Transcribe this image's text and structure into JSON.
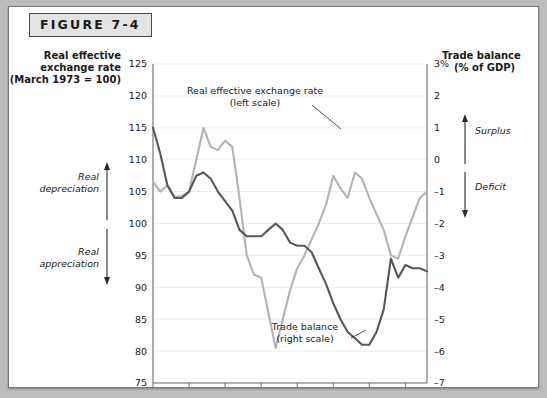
{
  "figure": {
    "label": "FIGURE 7-4"
  },
  "left_axis": {
    "title_line1": "Real effective",
    "title_line2": "exchange rate",
    "title_line3": "(March 1973 = 100)",
    "ticks": [
      "125",
      "120",
      "115",
      "110",
      "105",
      "100",
      "95",
      "90",
      "85",
      "80",
      "75"
    ],
    "arrow_up_label_line1": "Real",
    "arrow_up_label_line2": "depreciation",
    "arrow_down_label_line1": "Real",
    "arrow_down_label_line2": "appreciation"
  },
  "right_axis": {
    "title_line1": "Trade balance",
    "title_line2": "(% of GDP)",
    "ticks": [
      "3%",
      "2",
      "1",
      "0",
      "–1",
      "–2",
      "–3",
      "–4",
      "–5",
      "–6",
      "–7"
    ],
    "arrow_up_label": "Surplus",
    "arrow_down_label": "Deficit"
  },
  "annotations": {
    "series1_line1": "Real effective exchange rate",
    "series1_line2": "(left scale)",
    "series2_line1": "Trade balance",
    "series2_line2": "(right scale)"
  },
  "colors": {
    "exchange_rate": "#b3b3b3",
    "trade_balance": "#575757",
    "grid": "#ededed",
    "axis": "#6b6b6b",
    "frame": "#7a7a7a",
    "label_band": "#e3e3e3"
  },
  "chart_data": {
    "type": "line",
    "title": "FIGURE 7-4",
    "xlabel": "",
    "ylabel": "Real effective exchange rate (March 1973 = 100)",
    "y2label": "Trade balance (% of GDP)",
    "xlim": [
      1975,
      2013
    ],
    "ylim": [
      75,
      125
    ],
    "y2lim": [
      -7,
      3
    ],
    "grid": true,
    "legend": "annotations-inline",
    "xticks": [
      "1975",
      "1980",
      "1985",
      "1990",
      "1995",
      "2000",
      "2005",
      "2010"
    ],
    "yticks": [
      125,
      120,
      115,
      110,
      105,
      100,
      95,
      90,
      85,
      80,
      75
    ],
    "y2ticks": [
      3,
      2,
      1,
      0,
      -1,
      -2,
      -3,
      -4,
      -5,
      -6,
      -7
    ],
    "series": [
      {
        "name": "Real effective exchange rate (left scale)",
        "axis": "left",
        "color": "#b3b3b3",
        "x": [
          1975,
          1976,
          1977,
          1978,
          1979,
          1980,
          1981,
          1982,
          1983,
          1984,
          1985,
          1986,
          1987,
          1988,
          1989,
          1990,
          1991,
          1992,
          1993,
          1994,
          1995,
          1996,
          1997,
          1998,
          1999,
          2000,
          2001,
          2002,
          2003,
          2004,
          2005,
          2006,
          2007,
          2008,
          2009,
          2010,
          2011,
          2012,
          2013
        ],
        "values": [
          106.5,
          105.0,
          106.0,
          104.2,
          104.3,
          105.0,
          110.0,
          115.0,
          112.0,
          111.5,
          113.0,
          112.0,
          104.0,
          95.0,
          92.0,
          91.5,
          86.0,
          80.5,
          85.0,
          89.5,
          93.0,
          95.0,
          97.5,
          100.0,
          103.0,
          107.5,
          105.5,
          104.0,
          108.0,
          107.0,
          104.0,
          101.5,
          99.0,
          95.0,
          94.5,
          98.0,
          101.0,
          104.0,
          105.0
        ]
      },
      {
        "name": "Trade balance (right scale)",
        "axis": "right",
        "color": "#575757",
        "x": [
          1975,
          1976,
          1977,
          1978,
          1979,
          1980,
          1981,
          1982,
          1983,
          1984,
          1985,
          1986,
          1987,
          1988,
          1989,
          1990,
          1991,
          1992,
          1993,
          1994,
          1995,
          1996,
          1997,
          1998,
          1999,
          2000,
          2001,
          2002,
          2003,
          2004,
          2005,
          2006,
          2007,
          2008,
          2009,
          2010,
          2011,
          2012,
          2013
        ],
        "values": [
          1.0,
          0.2,
          -0.8,
          -1.2,
          -1.2,
          -1.0,
          -0.5,
          -0.4,
          -0.6,
          -1.0,
          -1.3,
          -1.6,
          -2.2,
          -2.4,
          -2.4,
          -2.4,
          -2.2,
          -2.0,
          -2.2,
          -2.6,
          -2.7,
          -2.7,
          -2.9,
          -3.4,
          -3.9,
          -4.5,
          -5.0,
          -5.4,
          -5.6,
          -5.8,
          -5.8,
          -5.4,
          -4.7,
          -3.1,
          -3.7,
          -3.3,
          -3.4,
          -3.4,
          -3.5
        ]
      }
    ],
    "annotations": [
      {
        "text": "Real effective exchange rate (left scale)",
        "x": 1991,
        "y": 120
      },
      {
        "text": "Trade balance (right scale)",
        "x": 1996,
        "y": 82
      }
    ]
  }
}
